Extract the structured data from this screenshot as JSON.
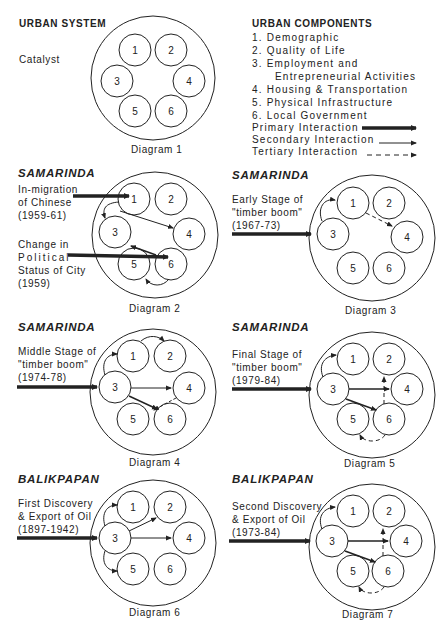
{
  "header": {
    "title": "URBAN SYSTEM",
    "catalyst_label": "Catalyst"
  },
  "legend": {
    "title": "URBAN COMPONENTS",
    "components": [
      "1. Demographic",
      "2. Quality of Life",
      "3. Employment and",
      "Entrepreneurial Activities",
      "4. Housing & Transportation",
      "5. Physical Infrastructure",
      "6. Local Government"
    ],
    "interactions": [
      {
        "label": "Primary Interaction",
        "style": "thick-solid"
      },
      {
        "label": "Secondary Interaction",
        "style": "thin-solid"
      },
      {
        "label": "Tertiary Interaction",
        "style": "dashed"
      }
    ]
  },
  "node_labels": [
    "1",
    "2",
    "3",
    "4",
    "5",
    "6"
  ],
  "diagrams": [
    {
      "caption": "Diagram 1",
      "city": "",
      "catalysts": []
    },
    {
      "caption": "Diagram 2",
      "city": "SAMARINDA",
      "catalysts": [
        {
          "lines": [
            "In-migration",
            "of Chinese",
            "(1959-61)"
          ],
          "target": "1"
        },
        {
          "lines": [
            "Change in",
            "Political",
            "Status of City",
            "(1959)"
          ],
          "target": "6"
        }
      ],
      "interactions": [
        {
          "from": "1",
          "to": "3",
          "type": "secondary"
        },
        {
          "from": "1",
          "to": "4",
          "type": "secondary"
        },
        {
          "from": "6",
          "to": "3",
          "type": "secondary"
        },
        {
          "from": "6",
          "to": "5",
          "type": "secondary"
        }
      ]
    },
    {
      "caption": "Diagram 3",
      "city": "SAMARINDA",
      "catalysts": [
        {
          "lines": [
            "Early Stage of",
            "\"timber boom\"",
            "(1967-73)"
          ],
          "target": "3"
        }
      ],
      "interactions": [
        {
          "from": "3",
          "to": "1",
          "type": "secondary"
        },
        {
          "from": "1",
          "to": "4",
          "type": "tertiary"
        }
      ]
    },
    {
      "caption": "Diagram 4",
      "city": "SAMARINDA",
      "catalysts": [
        {
          "lines": [
            "Middle Stage of",
            "\"timber boom\"",
            "(1974-78)"
          ],
          "target": "3"
        }
      ],
      "interactions": [
        {
          "from": "3",
          "to": "1",
          "type": "secondary"
        },
        {
          "from": "1",
          "to": "2",
          "type": "secondary"
        },
        {
          "from": "3",
          "to": "4",
          "type": "secondary"
        },
        {
          "from": "3",
          "to": "5/6",
          "type": "secondary"
        },
        {
          "from": "4",
          "to": "5/6",
          "type": "tertiary"
        }
      ]
    },
    {
      "caption": "Diagram 5",
      "city": "SAMARINDA",
      "catalysts": [
        {
          "lines": [
            "Final Stage of",
            "\"timber boom\"",
            "(1979-84)"
          ],
          "target": "3"
        }
      ],
      "interactions": [
        {
          "from": "3",
          "to": "1",
          "type": "secondary"
        },
        {
          "from": "3",
          "to": "4",
          "type": "secondary"
        },
        {
          "from": "3",
          "to": "6",
          "type": "secondary"
        },
        {
          "from": "6",
          "to": "2",
          "type": "tertiary"
        },
        {
          "from": "6",
          "to": "5",
          "type": "tertiary"
        }
      ]
    },
    {
      "caption": "Diagram 6",
      "city": "BALIKPAPAN",
      "catalysts": [
        {
          "lines": [
            "First Discovery",
            "& Export of Oil",
            "(1897-1942)"
          ],
          "target": "3"
        }
      ],
      "interactions": [
        {
          "from": "3",
          "to": "1",
          "type": "secondary"
        },
        {
          "from": "3",
          "to": "2",
          "type": "secondary"
        },
        {
          "from": "3",
          "to": "4",
          "type": "secondary"
        },
        {
          "from": "3",
          "to": "5",
          "type": "secondary"
        }
      ]
    },
    {
      "caption": "Diagram 7",
      "city": "BALIKPAPAN",
      "catalysts": [
        {
          "lines": [
            "Second Discovery",
            "& Export of Oil",
            "(1973-84)"
          ],
          "target": "3"
        }
      ],
      "interactions": [
        {
          "from": "3",
          "to": "1",
          "type": "secondary"
        },
        {
          "from": "3",
          "to": "4",
          "type": "secondary"
        },
        {
          "from": "3",
          "to": "6",
          "type": "secondary"
        },
        {
          "from": "6",
          "to": "2",
          "type": "tertiary"
        },
        {
          "from": "6",
          "to": "5",
          "type": "tertiary"
        }
      ]
    }
  ]
}
